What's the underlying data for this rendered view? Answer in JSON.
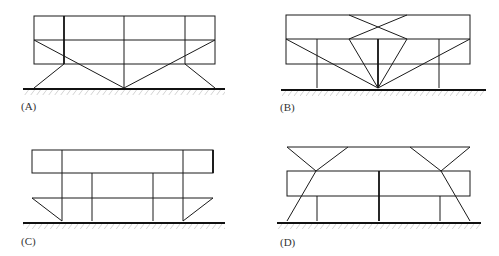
{
  "figure": {
    "panels": [
      {
        "id": "A",
        "label": "(A)",
        "description": "Two-tier frame supported by V-shaped diagonal struts meeting at a central ground point, with outer inclined legs"
      },
      {
        "id": "B",
        "label": "(B)",
        "description": "Two-tier frame with crossed bracing in upper tier and fan of struts converging to single central ground point, plus two vertical posts"
      },
      {
        "id": "C",
        "label": "(C)",
        "description": "Upper box frame resting on grid of vertical posts with triangular end brackets at base"
      },
      {
        "id": "D",
        "label": "(D)",
        "description": "Box frame with top cantilevered beam and inclined struts passing through frame to ground, vertical posts underneath"
      }
    ]
  },
  "colors": {
    "line": "#1a1a1a",
    "hatch": "#c8c8c8",
    "background": "#ffffff"
  }
}
